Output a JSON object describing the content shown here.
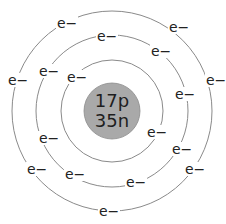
{
  "diagram": {
    "nucleus": {
      "line1": "17p",
      "line2": "35n",
      "protons": 17,
      "neutrons": 35,
      "fill_color": "#a9a9a9"
    },
    "electron_label": "e−",
    "orbit_color": "#8a8a8a",
    "shells": [
      {
        "name": "inner",
        "radius": 51,
        "electron_count": 2,
        "electrons": [
          {
            "x": 72,
            "y": 78
          },
          {
            "x": 152,
            "y": 133
          }
        ]
      },
      {
        "name": "middle",
        "radius": 76,
        "electron_count": 8,
        "electrons": [
          {
            "x": 102,
            "y": 37
          },
          {
            "x": 156,
            "y": 52
          },
          {
            "x": 44,
            "y": 72
          },
          {
            "x": 180,
            "y": 95
          },
          {
            "x": 44,
            "y": 139
          },
          {
            "x": 177,
            "y": 150
          },
          {
            "x": 70,
            "y": 175
          },
          {
            "x": 131,
            "y": 183
          }
        ]
      },
      {
        "name": "outer",
        "radius": 100,
        "electron_count": 7,
        "electrons": [
          {
            "x": 62,
            "y": 24
          },
          {
            "x": 174,
            "y": 28
          },
          {
            "x": 13,
            "y": 81
          },
          {
            "x": 211,
            "y": 81
          },
          {
            "x": 32,
            "y": 170
          },
          {
            "x": 190,
            "y": 170
          },
          {
            "x": 104,
            "y": 212
          }
        ]
      }
    ]
  }
}
